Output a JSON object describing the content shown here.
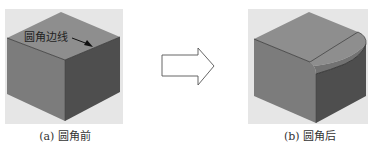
{
  "figure": {
    "panel_a": {
      "caption": "(a) 圆角前",
      "annotation": "圆角边线"
    },
    "panel_b": {
      "caption": "(b) 圆角后"
    },
    "transition": {
      "icon": "right-arrow-icon"
    }
  },
  "colors": {
    "background_box": "#e6e6e6",
    "top_face": "#8e8e8e",
    "left_face": "#7c7c7c",
    "right_face": "#4e4e4e",
    "fillet": "#727272",
    "edge": "#333333"
  }
}
